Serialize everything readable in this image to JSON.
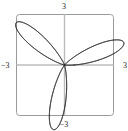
{
  "figure": {
    "kind": "polar-rose-plot",
    "background_color": "#ffffff",
    "frame_color": "#9a9a9a",
    "axis_color": "#bcbcbc",
    "curve_color": "#2b2b2b"
  },
  "labels": {
    "top": "3",
    "bottom": "−3",
    "left": "−3",
    "right": "3"
  },
  "chart_data": {
    "type": "line",
    "title": "",
    "xlabel": "",
    "ylabel": "",
    "coordinate_system": "polar",
    "xlim": [
      -3,
      3
    ],
    "ylim": [
      -3,
      3
    ],
    "grid": false,
    "axes_through_origin": true,
    "xtick_labels": [
      "−3",
      "3"
    ],
    "ytick_labels": [
      "−3",
      "3"
    ],
    "legend": null,
    "curve": {
      "name": "rose",
      "equation": "r = 3*cos(3*theta) + 0.6*cos(9*theta)",
      "large_petal_count": 6,
      "large_petal_radius": 3,
      "small_petal_count": 6,
      "small_petal_radius": 0.9,
      "large_petal_angles_deg": [
        20,
        80,
        140,
        200,
        260,
        320
      ],
      "small_petal_angles_deg": [
        50,
        110,
        170,
        230,
        290,
        350
      ],
      "theta_range_deg": [
        0,
        360
      ],
      "samples": 1440
    }
  }
}
